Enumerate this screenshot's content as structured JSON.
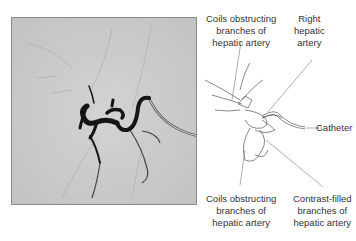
{
  "figure": {
    "photo": {
      "description": "Hepatic angiogram with coils and catheter",
      "background": "#c9c9c9"
    },
    "labels": {
      "top_left": [
        "Coils obstructing",
        "branches of",
        "hepatic artery"
      ],
      "top_right": [
        "Right",
        "hepatic",
        "artery"
      ],
      "catheter": "Catheter",
      "bottom_left": [
        "Coils obstructing",
        "branches of",
        "hepatic artery"
      ],
      "bottom_right": [
        "Contrast-filled",
        "branches of",
        "hepatic artery"
      ]
    }
  }
}
